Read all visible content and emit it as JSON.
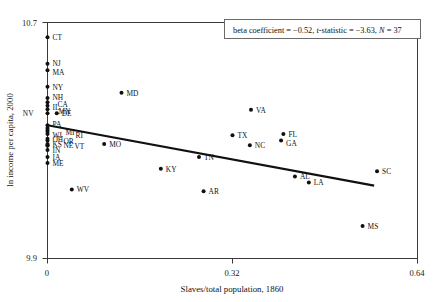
{
  "chart_data": {
    "type": "scatter",
    "title": "",
    "xlabel": "Slaves/total population, 1860",
    "ylabel": "ln income per capita, 2000",
    "xlim": [
      0,
      0.64
    ],
    "ylim": [
      9.9,
      10.7
    ],
    "xticks": [
      "0",
      "0.32",
      "0.64"
    ],
    "yticks": [
      "10.7",
      "9.9"
    ],
    "grid": false,
    "legend_position": "top-right",
    "annotation": "beta coefficient = −0.52, t-statistic = −3.63, N = 37",
    "annotation_parts": {
      "beta_label": "beta coefficient = ",
      "beta_value": "−0.52,",
      "t_label": "t",
      "t_rest": "-statistic = ",
      "t_value": "−3.63,",
      "n_label": "N",
      "n_value": " = 37"
    },
    "fit_line": {
      "x_start": 0.0,
      "y_start": 10.352,
      "x_end": 0.565,
      "y_end": 10.147
    },
    "points": [
      {
        "label": "CT",
        "x": 0.0,
        "y": 10.65,
        "lx": 5,
        "ly": 2.8
      },
      {
        "label": "NJ",
        "x": 0.0,
        "y": 10.56,
        "lx": 5,
        "ly": 2.1
      },
      {
        "label": "MA",
        "x": 0.0,
        "y": 10.538,
        "lx": 5,
        "ly": 4.5
      },
      {
        "label": "NY",
        "x": 0.0,
        "y": 10.482,
        "lx": 5,
        "ly": 2.8
      },
      {
        "label": "NH",
        "x": 0.0,
        "y": 10.444,
        "lx": 5,
        "ly": 2.1
      },
      {
        "label": "CA",
        "x": 0.0,
        "y": 10.43,
        "lx": 10,
        "ly": 5.2
      },
      {
        "label": "IL",
        "x": 0.0,
        "y": 10.418,
        "lx": 5,
        "ly": 4.0
      },
      {
        "label": "MN",
        "x": 0.0,
        "y": 10.406,
        "lx": 11,
        "ly": 5.0
      },
      {
        "label": "NV",
        "x": 0.0,
        "y": 10.392,
        "lx": -14,
        "ly": 3.0
      },
      {
        "label": "DE",
        "x": 0.016,
        "y": 10.392,
        "lx": 5,
        "ly": 2.8
      },
      {
        "label": "PA",
        "x": 0.0,
        "y": 10.352,
        "lx": 5,
        "ly": 2.2
      },
      {
        "label": "MD2",
        "x": 0.0,
        "y": 10.342,
        "lx": 0,
        "ly": 0
      },
      {
        "label": "MI",
        "x": 0.0,
        "y": 10.336,
        "lx": 18,
        "ly": 5.0
      },
      {
        "label": "RI",
        "x": 0.0,
        "y": 10.33,
        "lx": 28,
        "ly": 6.6
      },
      {
        "label": "WI",
        "x": 0.0,
        "y": 10.322,
        "lx": 5,
        "ly": 4.2
      },
      {
        "label": "OH",
        "x": 0.0,
        "y": 10.306,
        "lx": 5,
        "ly": 3.0
      },
      {
        "label": "OR",
        "x": 0.0,
        "y": 10.3,
        "lx": 16,
        "ly": 3.4
      },
      {
        "label": "KS",
        "x": 0.0,
        "y": 10.288,
        "lx": 5,
        "ly": 3.2
      },
      {
        "label": "NE",
        "x": 0.0,
        "y": 10.284,
        "lx": 16,
        "ly": 3.2
      },
      {
        "label": "VT",
        "x": 0.0,
        "y": 10.282,
        "lx": 27,
        "ly": 3.4
      },
      {
        "label": "IN",
        "x": 0.0,
        "y": 10.268,
        "lx": 5,
        "ly": 3.0
      },
      {
        "label": "IA",
        "x": 0.0,
        "y": 10.244,
        "lx": 5,
        "ly": 3.0
      },
      {
        "label": "ME",
        "x": 0.0,
        "y": 10.224,
        "lx": 5,
        "ly": 3.0
      },
      {
        "label": "MD",
        "x": 0.128,
        "y": 10.462,
        "lx": 5,
        "ly": 2.8
      },
      {
        "label": "MO",
        "x": 0.098,
        "y": 10.288,
        "lx": 5,
        "ly": 2.8
      },
      {
        "label": "WV",
        "x": 0.042,
        "y": 10.134,
        "lx": 5,
        "ly": 2.8
      },
      {
        "label": "KY",
        "x": 0.196,
        "y": 10.204,
        "lx": 5,
        "ly": 2.8
      },
      {
        "label": "TN",
        "x": 0.262,
        "y": 10.244,
        "lx": 5,
        "ly": 2.8
      },
      {
        "label": "AR",
        "x": 0.27,
        "y": 10.128,
        "lx": 5,
        "ly": 2.8
      },
      {
        "label": "TX",
        "x": 0.32,
        "y": 10.318,
        "lx": 5,
        "ly": 2.8
      },
      {
        "label": "NC",
        "x": 0.35,
        "y": 10.284,
        "lx": 5,
        "ly": 2.8
      },
      {
        "label": "VA",
        "x": 0.352,
        "y": 10.404,
        "lx": 5,
        "ly": 2.8
      },
      {
        "label": "FL",
        "x": 0.408,
        "y": 10.322,
        "lx": 5,
        "ly": 2.8
      },
      {
        "label": "GA",
        "x": 0.404,
        "y": 10.3,
        "lx": 5,
        "ly": 5.8
      },
      {
        "label": "AL",
        "x": 0.428,
        "y": 10.178,
        "lx": 5,
        "ly": 2.8
      },
      {
        "label": "LA",
        "x": 0.452,
        "y": 10.158,
        "lx": 5,
        "ly": 2.8
      },
      {
        "label": "SC",
        "x": 0.57,
        "y": 10.196,
        "lx": 5,
        "ly": 2.8
      },
      {
        "label": "MS",
        "x": 0.545,
        "y": 10.01,
        "lx": 5,
        "ly": 2.8
      }
    ]
  }
}
